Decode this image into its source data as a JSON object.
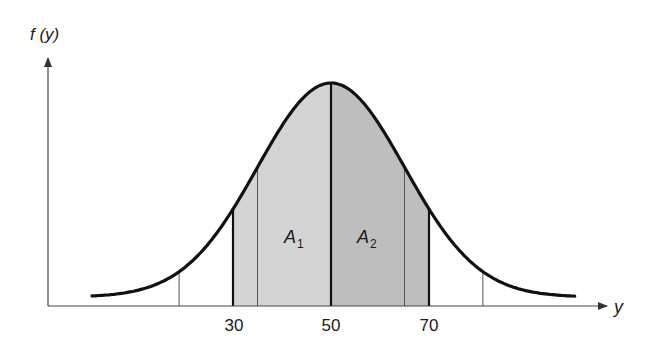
{
  "chart_data": {
    "type": "area",
    "title": "",
    "xlabel": "y",
    "ylabel": "f (y)",
    "distribution": "normal",
    "mean": 50,
    "std_approx": 15,
    "xticks": [
      30,
      50,
      70
    ],
    "xtick_labels": [
      "30",
      "50",
      "70"
    ],
    "shaded_regions": [
      {
        "name": "A1",
        "from": 30,
        "to": 50,
        "label": "A",
        "subscript": "1"
      },
      {
        "name": "A2",
        "from": 50,
        "to": 70,
        "label": "A",
        "subscript": "2"
      }
    ],
    "vertical_lines": [
      {
        "x": 19,
        "style": "thin"
      },
      {
        "x": 30,
        "style": "thick"
      },
      {
        "x": 35,
        "style": "thin"
      },
      {
        "x": 50,
        "style": "thick"
      },
      {
        "x": 65,
        "style": "thin"
      },
      {
        "x": 70,
        "style": "thick"
      },
      {
        "x": 81,
        "style": "thin"
      }
    ],
    "grid": false,
    "legend": null
  },
  "labels": {
    "y_axis": "f (y)",
    "x_axis": "y",
    "tick_30": "30",
    "tick_50": "50",
    "tick_70": "70",
    "area1_main": "A",
    "area1_sub": "1",
    "area2_main": "A",
    "area2_sub": "2"
  },
  "colors": {
    "area1": "#d3d3d3",
    "area2": "#bdbdbd",
    "curve": "#111111",
    "axis": "#333333"
  }
}
